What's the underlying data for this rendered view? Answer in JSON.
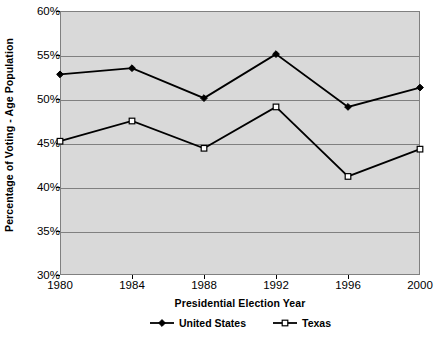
{
  "chart_data": {
    "type": "line",
    "title": "",
    "subtitle": "",
    "xlabel": "Presidential Election Year",
    "ylabel": "Percentage of Voting - Age Population",
    "categories": [
      "1980",
      "1984",
      "1988",
      "1992",
      "1996",
      "2000"
    ],
    "x": [
      1980,
      1984,
      1988,
      1992,
      1996,
      2000
    ],
    "xlim": [
      1980,
      2000
    ],
    "ylim": [
      30,
      60
    ],
    "ytick_labels": [
      "60%",
      "55%",
      "50%",
      "45%",
      "40%",
      "35%",
      "30%"
    ],
    "ytick_values": [
      60,
      55,
      50,
      45,
      40,
      35,
      30
    ],
    "ytick_step": 5,
    "grid": "horizontal",
    "legend_position": "bottom",
    "plot_background": "#d9d9d9",
    "series": [
      {
        "name": "United States",
        "marker": "filled-diamond",
        "color": "#000000",
        "values": [
          52.8,
          53.5,
          50.1,
          55.1,
          49.1,
          51.3
        ]
      },
      {
        "name": "Texas",
        "marker": "open-square",
        "color": "#000000",
        "values": [
          45.2,
          47.5,
          44.4,
          49.1,
          41.2,
          44.3
        ]
      }
    ]
  },
  "legend": {
    "entries": [
      {
        "label": "United States"
      },
      {
        "label": "Texas"
      }
    ]
  },
  "axes": {
    "y_title": "Percentage of Voting - Age Population",
    "x_title": "Presidential Election Year"
  }
}
